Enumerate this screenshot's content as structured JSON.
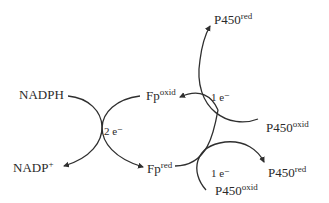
{
  "diagram": {
    "colors": {
      "line": "#2f2f2f",
      "text": "#2a2a2a",
      "background": "#ffffff"
    },
    "left_exchange": {
      "donor": {
        "base": "NADPH",
        "sup": ""
      },
      "donor_product": {
        "base": "NADP",
        "sup": "+"
      },
      "acceptor": {
        "base": "Fp",
        "sup": "oxid"
      },
      "acceptor_product": {
        "base": "Fp",
        "sup": "red"
      },
      "electrons": "2 e⁻"
    },
    "upper_right_exchange": {
      "electrons": "1 e⁻",
      "acceptor": {
        "base": "P450",
        "sup": "oxid"
      },
      "acceptor_product": {
        "base": "P450",
        "sup": "red"
      }
    },
    "lower_right_exchange": {
      "electrons": "1 e⁻",
      "acceptor": {
        "base": "P450",
        "sup": "oxid"
      },
      "acceptor_product": {
        "base": "P450",
        "sup": "red"
      }
    }
  }
}
